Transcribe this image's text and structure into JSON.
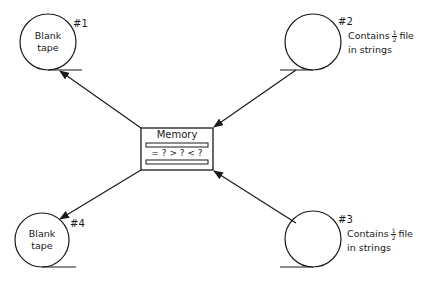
{
  "memory": {
    "title": "Memory",
    "comparison": "= ? > ? < ?"
  },
  "tapes": [
    {
      "id": "#1",
      "label_lines": [
        "Blank",
        "tape"
      ]
    },
    {
      "id": "#2",
      "label_prefix": "Contains",
      "fraction": {
        "num": "1",
        "den": "2"
      },
      "label_suffix": "file",
      "label_line2": "in strings"
    },
    {
      "id": "#3",
      "label_prefix": "Contains",
      "fraction": {
        "num": "1",
        "den": "2"
      },
      "label_suffix": "file",
      "label_line2": "in strings"
    },
    {
      "id": "#4",
      "label_lines": [
        "Blank",
        "tape"
      ]
    }
  ],
  "colors": {
    "stroke": "#1a1a1a",
    "background": "#ffffff"
  }
}
